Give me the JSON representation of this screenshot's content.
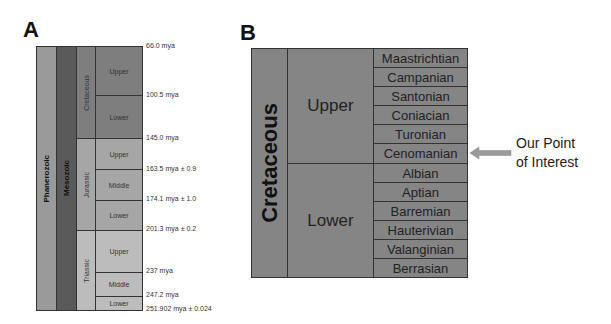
{
  "panelA": {
    "label": "A",
    "eon": "Phanerozoic",
    "era": "Mesozoic",
    "periods": [
      {
        "name": "Cretaceous",
        "epochs": [
          "Upper",
          "Lower"
        ]
      },
      {
        "name": "Jurassic",
        "epochs": [
          "Upper",
          "Middle",
          "Lower"
        ]
      },
      {
        "name": "Triassic",
        "epochs": [
          "Upper",
          "Middle",
          "Lower"
        ]
      }
    ],
    "dates": [
      "66.0 mya",
      "100.5 mya",
      "145.0 mya",
      "163.5 mya ± 0.9",
      "174.1 mya ± 1.0",
      "201.3 mya ± 0.2",
      "237 mya",
      "247.2 mya",
      "251.902 mya ± 0.024"
    ]
  },
  "panelB": {
    "label": "B",
    "period": "Cretaceous",
    "epochs": [
      "Upper",
      "Lower"
    ],
    "stages": [
      "Maastrichtian",
      "Campanian",
      "Santonian",
      "Coniacian",
      "Turonian",
      "Cenomanian",
      "Albian",
      "Aptian",
      "Barremian",
      "Hauterivian",
      "Valanginian",
      "Berrasian"
    ],
    "annotation_line1": "Our Point",
    "annotation_line2": "of Interest"
  },
  "colors": {
    "phanerozoic": "#9a9a9a",
    "mesozoic": "#5a5a5a",
    "cretaceous": "#7e7e7e",
    "jurassic": "#a6a6a6",
    "triassic": "#bcbcbc",
    "panelB": "#858585",
    "arrow": "#9a9a9a"
  }
}
